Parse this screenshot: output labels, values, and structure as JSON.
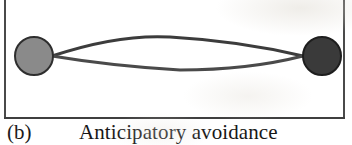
{
  "figure": {
    "panel_letter": "(b)",
    "title": "Anticipatory avoidance",
    "frame": {
      "visible_borders": "left, right, bottom (top edge cropped at image boundary)",
      "border_color": "#4a4a4a",
      "border_width_px": 2,
      "left_px": 4,
      "right_px": 345,
      "bottom_px": 118
    },
    "background_color": "#ffffff",
    "nodes": [
      {
        "name": "left-node",
        "cx": 34,
        "cy": 56,
        "r": 19,
        "fill": "#8a8a8a",
        "stroke": "#2e2e2e",
        "stroke_width": 2,
        "shade": "medium gray"
      },
      {
        "name": "right-node",
        "cx": 322,
        "cy": 56,
        "r": 19,
        "fill": "#3a3a3a",
        "stroke": "#1e1e1e",
        "stroke_width": 2,
        "shade": "dark gray"
      }
    ],
    "edges": [
      {
        "name": "upper-path",
        "from_x": 52,
        "from_y": 56,
        "to_x": 303,
        "to_y": 56,
        "peak_x": 170,
        "peak_y": 37,
        "direction": "bows upward",
        "stroke": "#3c3c3c",
        "stroke_width": 3
      },
      {
        "name": "lower-path",
        "from_x": 52,
        "from_y": 56,
        "to_x": 303,
        "to_y": 56,
        "peak_x": 180,
        "peak_y": 70,
        "direction": "bows downward",
        "stroke": "#4a4a4a",
        "stroke_width": 3
      }
    ]
  }
}
